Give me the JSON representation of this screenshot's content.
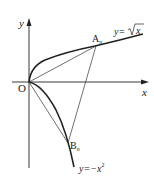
{
  "diagram": {
    "type": "coordinate-plane",
    "axes": {
      "x_label": "x",
      "y_label": "y",
      "origin_label": "O"
    },
    "curves": [
      {
        "name": "sqrt-curve",
        "label_prefix": "y=",
        "label_expr": "√x",
        "equation": "y = √x"
      },
      {
        "name": "neg-square-curve",
        "label": "y=−x²",
        "label_prefix": "y=−x",
        "label_sup": "2",
        "equation": "y = −x²"
      }
    ],
    "points": [
      {
        "name": "A_n",
        "label": "A",
        "sub": "n"
      },
      {
        "name": "B_n",
        "label": "B",
        "sub": "n"
      },
      {
        "name": "O",
        "label": "O"
      }
    ],
    "segments": [
      "OA_n",
      "OB_n",
      "A_nB_n"
    ],
    "colors": {
      "stroke": "#222222",
      "background": "#ffffff"
    }
  }
}
